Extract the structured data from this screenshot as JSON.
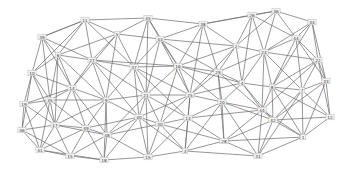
{
  "diagram": {
    "type": "network-graph",
    "edge_color": "#6a6a6a",
    "node_fill": "#f4f4f4",
    "nodes": [
      {
        "id": "n0",
        "label": "11",
        "x": 85,
        "y": 20
      },
      {
        "id": "n1",
        "label": "45",
        "x": 148,
        "y": 18
      },
      {
        "id": "n2",
        "label": "38",
        "x": 203,
        "y": 24
      },
      {
        "id": "n3",
        "label": "26",
        "x": 252,
        "y": 15
      },
      {
        "id": "n4",
        "label": "36",
        "x": 276,
        "y": 11
      },
      {
        "id": "n5",
        "label": "34",
        "x": 312,
        "y": 22
      },
      {
        "id": "n6",
        "label": "39",
        "x": 42,
        "y": 37
      },
      {
        "id": "n7",
        "label": "5",
        "x": 117,
        "y": 34
      },
      {
        "id": "n8",
        "label": "43",
        "x": 160,
        "y": 39
      },
      {
        "id": "n9",
        "label": "2",
        "x": 236,
        "y": 46
      },
      {
        "id": "n10",
        "label": "44",
        "x": 296,
        "y": 38
      },
      {
        "id": "n11",
        "label": "6",
        "x": 58,
        "y": 55
      },
      {
        "id": "n12",
        "label": "27",
        "x": 92,
        "y": 60
      },
      {
        "id": "n13",
        "label": "37",
        "x": 134,
        "y": 67
      },
      {
        "id": "n14",
        "label": "16",
        "x": 178,
        "y": 66
      },
      {
        "id": "n15",
        "label": "29",
        "x": 218,
        "y": 72
      },
      {
        "id": "n16",
        "label": "24",
        "x": 264,
        "y": 52
      },
      {
        "id": "n17",
        "label": "22",
        "x": 318,
        "y": 60
      },
      {
        "id": "n18",
        "label": "10",
        "x": 32,
        "y": 73
      },
      {
        "id": "n19",
        "label": "14",
        "x": 72,
        "y": 88
      },
      {
        "id": "n20",
        "label": "4",
        "x": 242,
        "y": 83
      },
      {
        "id": "n21",
        "label": "8",
        "x": 272,
        "y": 87
      },
      {
        "id": "n22",
        "label": "7",
        "x": 302,
        "y": 90
      },
      {
        "id": "n23",
        "label": "33",
        "x": 326,
        "y": 81
      },
      {
        "id": "n24",
        "label": "19",
        "x": 24,
        "y": 104
      },
      {
        "id": "n25",
        "label": "35",
        "x": 50,
        "y": 100
      },
      {
        "id": "n26",
        "label": "9",
        "x": 106,
        "y": 100
      },
      {
        "id": "n27",
        "label": "21",
        "x": 146,
        "y": 95
      },
      {
        "id": "n28",
        "label": "25",
        "x": 190,
        "y": 95
      },
      {
        "id": "n29",
        "label": "20",
        "x": 222,
        "y": 102
      },
      {
        "id": "n30",
        "label": "44",
        "x": 262,
        "y": 110
      },
      {
        "id": "n31",
        "label": "17",
        "x": 55,
        "y": 125
      },
      {
        "id": "n32",
        "label": "49",
        "x": 86,
        "y": 128
      },
      {
        "id": "n33",
        "label": "40",
        "x": 139,
        "y": 117
      },
      {
        "id": "n34",
        "label": "30",
        "x": 160,
        "y": 124
      },
      {
        "id": "n35",
        "label": "13",
        "x": 188,
        "y": 118
      },
      {
        "id": "n36",
        "label": "42",
        "x": 273,
        "y": 120
      },
      {
        "id": "n37",
        "label": "12",
        "x": 330,
        "y": 117
      },
      {
        "id": "n38",
        "label": "46",
        "x": 22,
        "y": 130
      },
      {
        "id": "n39",
        "label": "48",
        "x": 107,
        "y": 135
      },
      {
        "id": "n40",
        "label": "1",
        "x": 303,
        "y": 137
      },
      {
        "id": "n41",
        "label": "28",
        "x": 224,
        "y": 141
      },
      {
        "id": "n42",
        "label": "41",
        "x": 40,
        "y": 150
      },
      {
        "id": "n43",
        "label": "15",
        "x": 70,
        "y": 156
      },
      {
        "id": "n44",
        "label": "18",
        "x": 104,
        "y": 160
      },
      {
        "id": "n45",
        "label": "15",
        "x": 148,
        "y": 157
      },
      {
        "id": "n46",
        "label": "3",
        "x": 185,
        "y": 151
      },
      {
        "id": "n47",
        "label": "31",
        "x": 258,
        "y": 156
      }
    ],
    "edges": [
      [
        0,
        1
      ],
      [
        0,
        6
      ],
      [
        0,
        7
      ],
      [
        0,
        11
      ],
      [
        0,
        12
      ],
      [
        0,
        13
      ],
      [
        1,
        2
      ],
      [
        1,
        7
      ],
      [
        1,
        8
      ],
      [
        1,
        13
      ],
      [
        1,
        14
      ],
      [
        2,
        3
      ],
      [
        2,
        8
      ],
      [
        2,
        9
      ],
      [
        2,
        14
      ],
      [
        2,
        15
      ],
      [
        3,
        4
      ],
      [
        3,
        9
      ],
      [
        3,
        16
      ],
      [
        3,
        10
      ],
      [
        4,
        5
      ],
      [
        4,
        10
      ],
      [
        4,
        16
      ],
      [
        4,
        9
      ],
      [
        5,
        10
      ],
      [
        5,
        17
      ],
      [
        5,
        16
      ],
      [
        5,
        23
      ],
      [
        6,
        11
      ],
      [
        6,
        18
      ],
      [
        6,
        12
      ],
      [
        6,
        19
      ],
      [
        6,
        0
      ],
      [
        7,
        8
      ],
      [
        7,
        11
      ],
      [
        7,
        12
      ],
      [
        7,
        13
      ],
      [
        7,
        26
      ],
      [
        8,
        13
      ],
      [
        8,
        14
      ],
      [
        8,
        15
      ],
      [
        8,
        27
      ],
      [
        8,
        9
      ],
      [
        9,
        15
      ],
      [
        9,
        16
      ],
      [
        9,
        20
      ],
      [
        9,
        28
      ],
      [
        10,
        16
      ],
      [
        10,
        17
      ],
      [
        10,
        21
      ],
      [
        10,
        22
      ],
      [
        11,
        12
      ],
      [
        11,
        18
      ],
      [
        11,
        19
      ],
      [
        11,
        25
      ],
      [
        11,
        26
      ],
      [
        12,
        13
      ],
      [
        12,
        19
      ],
      [
        12,
        26
      ],
      [
        12,
        27
      ],
      [
        12,
        14
      ],
      [
        13,
        14
      ],
      [
        13,
        26
      ],
      [
        13,
        27
      ],
      [
        13,
        33
      ],
      [
        13,
        28
      ],
      [
        14,
        15
      ],
      [
        14,
        27
      ],
      [
        14,
        28
      ],
      [
        14,
        29
      ],
      [
        14,
        20
      ],
      [
        15,
        20
      ],
      [
        15,
        28
      ],
      [
        15,
        29
      ],
      [
        15,
        16
      ],
      [
        15,
        30
      ],
      [
        16,
        17
      ],
      [
        16,
        20
      ],
      [
        16,
        21
      ],
      [
        16,
        22
      ],
      [
        17,
        22
      ],
      [
        17,
        23
      ],
      [
        17,
        21
      ],
      [
        17,
        37
      ],
      [
        18,
        19
      ],
      [
        18,
        24
      ],
      [
        18,
        25
      ],
      [
        18,
        38
      ],
      [
        19,
        25
      ],
      [
        19,
        26
      ],
      [
        19,
        31
      ],
      [
        19,
        32
      ],
      [
        19,
        24
      ],
      [
        20,
        21
      ],
      [
        20,
        29
      ],
      [
        20,
        30
      ],
      [
        20,
        36
      ],
      [
        20,
        28
      ],
      [
        21,
        22
      ],
      [
        21,
        30
      ],
      [
        21,
        36
      ],
      [
        21,
        40
      ],
      [
        22,
        23
      ],
      [
        22,
        37
      ],
      [
        22,
        36
      ],
      [
        22,
        40
      ],
      [
        23,
        37
      ],
      [
        23,
        40
      ],
      [
        24,
        25
      ],
      [
        24,
        38
      ],
      [
        24,
        31
      ],
      [
        24,
        42
      ],
      [
        25,
        31
      ],
      [
        25,
        32
      ],
      [
        25,
        26
      ],
      [
        25,
        38
      ],
      [
        26,
        27
      ],
      [
        26,
        32
      ],
      [
        26,
        33
      ],
      [
        26,
        39
      ],
      [
        26,
        31
      ],
      [
        27,
        28
      ],
      [
        27,
        33
      ],
      [
        27,
        34
      ],
      [
        27,
        35
      ],
      [
        27,
        39
      ],
      [
        28,
        29
      ],
      [
        28,
        34
      ],
      [
        28,
        35
      ],
      [
        28,
        33
      ],
      [
        29,
        30
      ],
      [
        29,
        35
      ],
      [
        29,
        41
      ],
      [
        29,
        36
      ],
      [
        29,
        46
      ],
      [
        30,
        36
      ],
      [
        30,
        41
      ],
      [
        30,
        40
      ],
      [
        30,
        47
      ],
      [
        30,
        35
      ],
      [
        31,
        32
      ],
      [
        31,
        38
      ],
      [
        31,
        42
      ],
      [
        31,
        43
      ],
      [
        31,
        39
      ],
      [
        32,
        39
      ],
      [
        32,
        43
      ],
      [
        32,
        44
      ],
      [
        32,
        33
      ],
      [
        32,
        42
      ],
      [
        33,
        34
      ],
      [
        33,
        39
      ],
      [
        33,
        45
      ],
      [
        33,
        44
      ],
      [
        34,
        35
      ],
      [
        34,
        45
      ],
      [
        34,
        46
      ],
      [
        34,
        39
      ],
      [
        35,
        46
      ],
      [
        35,
        41
      ],
      [
        35,
        45
      ],
      [
        36,
        37
      ],
      [
        36,
        40
      ],
      [
        36,
        41
      ],
      [
        36,
        47
      ],
      [
        37,
        40
      ],
      [
        38,
        42
      ],
      [
        38,
        43
      ],
      [
        39,
        44
      ],
      [
        39,
        45
      ],
      [
        39,
        43
      ],
      [
        40,
        47
      ],
      [
        40,
        41
      ],
      [
        41,
        46
      ],
      [
        41,
        47
      ],
      [
        42,
        43
      ],
      [
        42,
        44
      ],
      [
        43,
        44
      ],
      [
        44,
        45
      ],
      [
        45,
        46
      ],
      [
        46,
        47
      ],
      [
        0,
        18
      ],
      [
        1,
        27
      ],
      [
        2,
        28
      ],
      [
        3,
        20
      ],
      [
        5,
        21
      ],
      [
        7,
        19
      ],
      [
        8,
        28
      ],
      [
        11,
        31
      ],
      [
        12,
        33
      ],
      [
        13,
        35
      ],
      [
        14,
        34
      ],
      [
        15,
        41
      ],
      [
        16,
        30
      ],
      [
        17,
        30
      ],
      [
        18,
        31
      ],
      [
        19,
        39
      ],
      [
        22,
        47
      ],
      [
        23,
        36
      ],
      [
        25,
        42
      ],
      [
        26,
        44
      ],
      [
        27,
        45
      ],
      [
        28,
        46
      ],
      [
        29,
        47
      ],
      [
        33,
        46
      ],
      [
        34,
        41
      ],
      [
        10,
        23
      ],
      [
        4,
        2
      ],
      [
        6,
        25
      ],
      [
        9,
        14
      ],
      [
        21,
        37
      ]
    ]
  }
}
